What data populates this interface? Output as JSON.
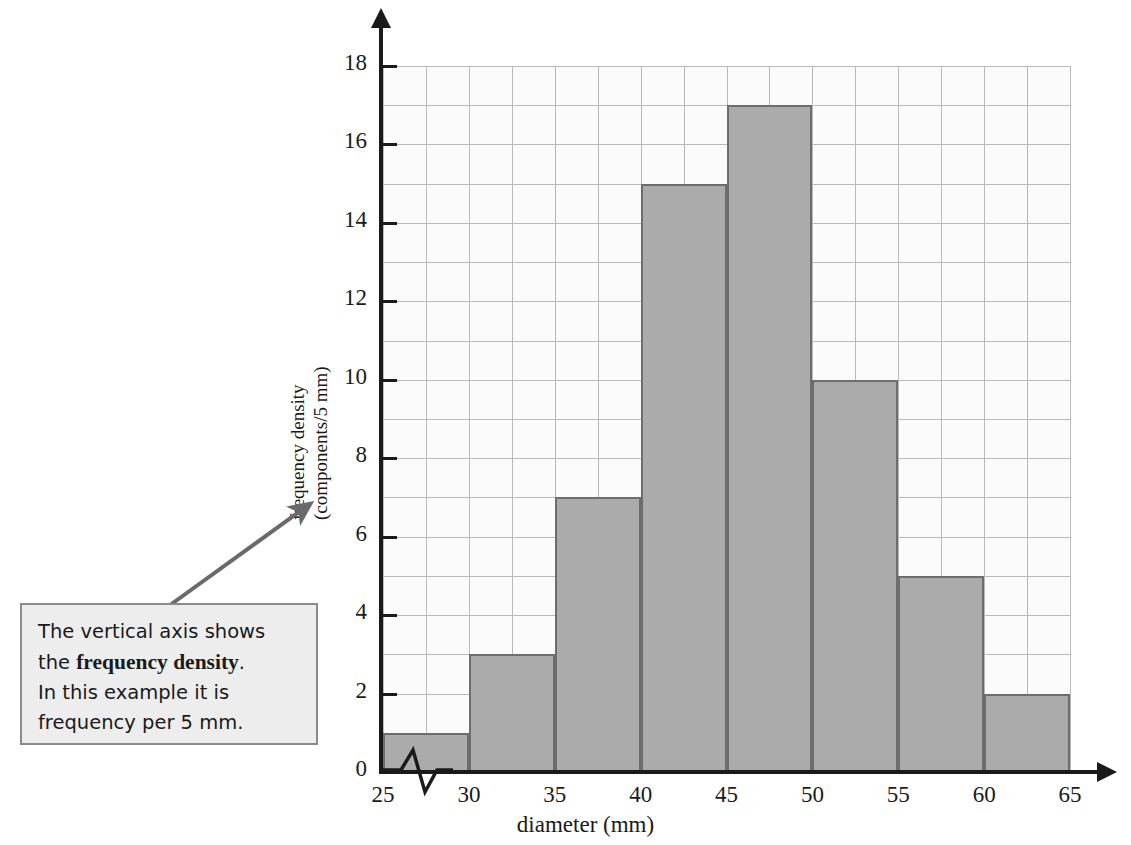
{
  "chart_data": {
    "type": "bar",
    "title": "",
    "xlabel": "diameter (mm)",
    "ylabel_line1": "frequency density",
    "ylabel_line2": "(components/5 mm)",
    "xlim": [
      25,
      65
    ],
    "ylim": [
      0,
      18
    ],
    "x_tick_labels": [
      "25",
      "30",
      "35",
      "40",
      "45",
      "50",
      "55",
      "60",
      "65"
    ],
    "x_tick_values": [
      25,
      30,
      35,
      40,
      45,
      50,
      55,
      60,
      65
    ],
    "y_tick_labels": [
      "0",
      "2",
      "4",
      "6",
      "8",
      "10",
      "12",
      "14",
      "16",
      "18"
    ],
    "y_tick_values": [
      0,
      2,
      4,
      6,
      8,
      10,
      12,
      14,
      16,
      18
    ],
    "y_minor_step": 1,
    "x_minor_step": 2.5,
    "grid": true,
    "legend": "none",
    "bin_width": 5,
    "categories": [
      "25-30",
      "30-35",
      "35-40",
      "40-45",
      "45-50",
      "50-55",
      "55-60",
      "60-65"
    ],
    "bin_edges": [
      25,
      30,
      35,
      40,
      45,
      50,
      55,
      60,
      65
    ],
    "values": [
      1,
      3,
      7,
      15,
      17,
      10,
      5,
      2
    ],
    "axis_break": true,
    "bar_fill_color": "#ababab",
    "bar_edge_color": "#6d6d6d",
    "grid_color": "#b9b9b9",
    "axis_color": "#1a1a1a",
    "plot_background": "#fbfbfb"
  },
  "callout": {
    "line1": "The vertical axis shows",
    "line2_prefix": "the ",
    "line2_bold": "frequency density",
    "line2_suffix": ".",
    "line3": "In this example it is",
    "line4": "frequency per 5 mm.",
    "background_color": "#ededed",
    "border_color": "#8b8b8b"
  }
}
